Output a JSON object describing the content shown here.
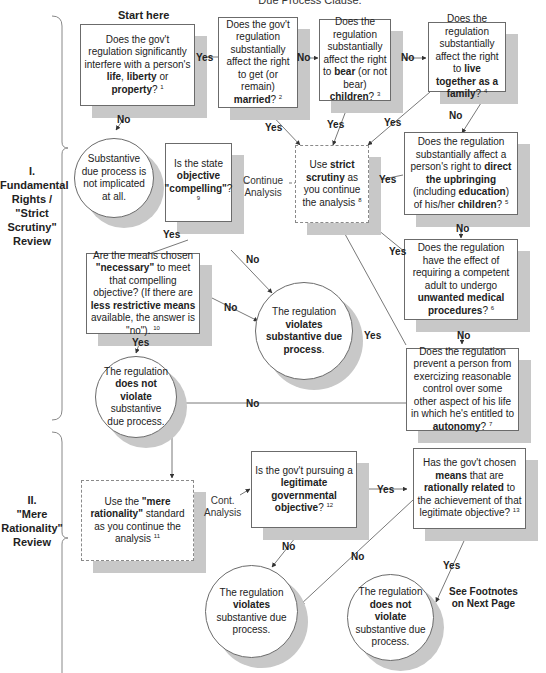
{
  "header": {
    "title_fragment": "Due Process Clause."
  },
  "start_label": "Start here",
  "sections": [
    {
      "id": "I",
      "lines": [
        "I.",
        "Fundamental",
        "Rights /",
        "\"Strict",
        "Scrutiny\"",
        "Review"
      ]
    },
    {
      "id": "II",
      "lines": [
        "II.",
        "\"Mere",
        "Rationality\"",
        "Review"
      ]
    }
  ],
  "nodes": {
    "q1": {
      "pre": "Does the gov't regulation significantly interfere with a person's ",
      "b1": "life",
      "mid1": ", ",
      "b2": "liberty",
      "mid2": " or ",
      "b3": "property",
      "post": "? ",
      "fn": "1"
    },
    "q2": {
      "pre": "Does the gov't regulation substantially affect the right to get (or remain) ",
      "b1": "married",
      "post": "? ",
      "fn": "2"
    },
    "q3": {
      "pre": "Does the regulation substantially affect the right to ",
      "b1": "bear",
      "mid1": " (or not bear) ",
      "b2": "children",
      "post": "? ",
      "fn": "3"
    },
    "q4": {
      "pre": "Does the regulation substantially affect the right to ",
      "b1": "live together as a family",
      "post": "? ",
      "fn": "4"
    },
    "q5": {
      "pre": "Does the regulation substantially affect a person's right to ",
      "b1": "direct the upbringing",
      "mid1": " (including ",
      "b2": "education",
      "mid2": ") of his/her ",
      "b3": "children",
      "post": "? ",
      "fn": "5"
    },
    "q6": {
      "pre": "Does the regulation  have the effect of requiring a competent adult to undergo ",
      "b1": "unwanted medical procedures",
      "post": "? ",
      "fn": "6"
    },
    "q7": {
      "pre": "Does the regulation prevent a person from exercizing reasonable control over some other aspect of his life in which he's entitled to ",
      "b1": "autonomy",
      "post": "? ",
      "fn": "7"
    },
    "strict": {
      "pre": "Use ",
      "b1": "strict scrutiny",
      "post": " as you continue the analysis ",
      "fn": "8"
    },
    "q9": {
      "pre": "Is the state ",
      "b1": "objective \"compelling\"",
      "post": "?",
      "fn": "9"
    },
    "q10": {
      "pre": "Are the means chosen ",
      "b1": "\"necessary\"",
      "mid1": " to meet that compelling objective? (If there are ",
      "b2": "less restrictive means",
      "post": " available, the answer is \"no\"). ",
      "fn": "10"
    },
    "not_implicated": {
      "text": "Substantive due process is not implicated at all."
    },
    "violates1": {
      "pre": "The regulation ",
      "b1": "violates substantive due process",
      "post": "."
    },
    "not_violate1": {
      "pre": "The regulation ",
      "b1": "does not violate",
      "post": " substantive due process."
    },
    "rational": {
      "pre": "Use the ",
      "b1": "\"mere rationality\"",
      "post": " standard as you continue the analysis ",
      "fn": "11"
    },
    "q12": {
      "pre": "Is the gov't pursuing a ",
      "b1": "legitimate governmental objective",
      "post": "? ",
      "fn": "12"
    },
    "q13": {
      "pre": "Has the gov't chosen ",
      "b1": "means",
      "mid1": " that are ",
      "b2": "rationally related",
      "post": " to the achievement of that legitimate objective? ",
      "fn": "13"
    },
    "violates2": {
      "pre": "The regulation ",
      "b1": "violates",
      "post": " substantive due process."
    },
    "not_violate2": {
      "pre": "The regulation ",
      "b1": "does not violate",
      "post": " substantive due process."
    }
  },
  "edge_labels": {
    "yes": "Yes",
    "no": "No",
    "continue_analysis_1": "Continue",
    "continue_analysis_2": "Analysis",
    "cont_analysis_1": "Cont.",
    "cont_analysis_2": "Analysis"
  },
  "footnote_note": [
    "See Footnotes",
    "on Next Page"
  ],
  "colors": {
    "line": "#555555",
    "shadow": "#c8c8c8",
    "border": "#6b6b6b",
    "bracket": "#888888"
  }
}
